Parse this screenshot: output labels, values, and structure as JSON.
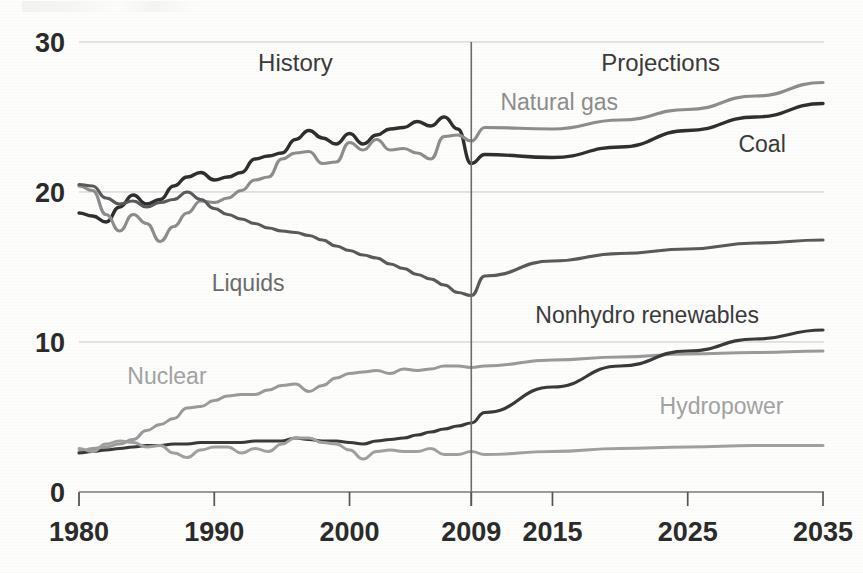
{
  "chart_data": {
    "type": "line",
    "title": "",
    "xlabel": "",
    "ylabel": "",
    "xlim": [
      1980,
      2035
    ],
    "ylim": [
      0,
      30
    ],
    "grid": true,
    "grid_axis": "y",
    "legend_position": "inline-annotations",
    "y_ticks": [
      0,
      10,
      20,
      30
    ],
    "y_tick_labels": [
      "0",
      "10",
      "20",
      "30"
    ],
    "x_ticks": [
      1980,
      1990,
      2000,
      2009,
      2015,
      2025,
      2035
    ],
    "x_tick_labels": [
      "1980",
      "1990",
      "2000",
      "2009",
      "2015",
      "2025",
      "2035"
    ],
    "annotations": [
      {
        "text": "History",
        "x": 1996,
        "y": 28.1,
        "color": "#3a3a3a"
      },
      {
        "text": "Projections",
        "x": 2023,
        "y": 28.1,
        "color": "#3a3a3a"
      },
      {
        "text": "Natural gas",
        "x": 2015.5,
        "y": 25.5,
        "color": "#8d8d8d"
      },
      {
        "text": "Coal",
        "x": 2030.5,
        "y": 22.7,
        "color": "#3a3a3a"
      },
      {
        "text": "Liquids",
        "x": 1992.5,
        "y": 13.4,
        "color": "#6b6b6b"
      },
      {
        "text": "Nonhydro renewables",
        "x": 2022,
        "y": 11.3,
        "color": "#3a3a3a"
      },
      {
        "text": "Nuclear",
        "x": 1986.5,
        "y": 7.2,
        "color": "#a2a2a2"
      },
      {
        "text": "Hydropower",
        "x": 2027.5,
        "y": 5.2,
        "color": "#a2a2a2"
      }
    ],
    "divider": {
      "x": 2009,
      "label": "history-projection-divider"
    },
    "series": [
      {
        "name": "Coal",
        "color": "#2f2f2f",
        "width": 3.4,
        "x": [
          1980,
          1981,
          1982,
          1983,
          1984,
          1985,
          1986,
          1987,
          1988,
          1989,
          1990,
          1991,
          1992,
          1993,
          1994,
          1995,
          1996,
          1997,
          1998,
          1999,
          2000,
          2001,
          2002,
          2003,
          2004,
          2005,
          2006,
          2007,
          2008,
          2009,
          2010,
          2015,
          2020,
          2025,
          2030,
          2035
        ],
        "values": [
          18.6,
          18.4,
          18.0,
          19.0,
          19.8,
          19.2,
          19.5,
          20.4,
          21.0,
          21.3,
          20.8,
          21.0,
          21.3,
          22.2,
          22.4,
          22.6,
          23.5,
          24.1,
          23.6,
          23.2,
          23.9,
          23.2,
          23.8,
          24.2,
          24.3,
          24.7,
          24.4,
          25.0,
          24.2,
          21.9,
          22.5,
          22.3,
          23.0,
          24.1,
          25.0,
          25.9
        ]
      },
      {
        "name": "Natural gas",
        "color": "#8d8d8d",
        "width": 3.2,
        "x": [
          1980,
          1981,
          1982,
          1983,
          1984,
          1985,
          1986,
          1987,
          1988,
          1989,
          1990,
          1991,
          1992,
          1993,
          1994,
          1995,
          1996,
          1997,
          1998,
          1999,
          2000,
          2001,
          2002,
          2003,
          2004,
          2005,
          2006,
          2007,
          2008,
          2009,
          2010,
          2015,
          2020,
          2025,
          2030,
          2035
        ],
        "values": [
          20.4,
          20.1,
          18.5,
          17.4,
          18.5,
          17.9,
          16.7,
          17.7,
          18.6,
          19.4,
          19.3,
          19.6,
          20.1,
          20.8,
          21.0,
          22.2,
          22.6,
          22.7,
          21.9,
          22.0,
          23.3,
          22.8,
          23.5,
          22.8,
          22.9,
          22.6,
          22.2,
          23.7,
          23.8,
          23.4,
          24.3,
          24.2,
          24.8,
          25.5,
          26.4,
          27.3
        ]
      },
      {
        "name": "Liquids",
        "color": "#5a5a5a",
        "width": 3.2,
        "x": [
          1980,
          1981,
          1982,
          1983,
          1984,
          1985,
          1986,
          1987,
          1988,
          1989,
          1990,
          1991,
          1992,
          1993,
          1994,
          1995,
          1996,
          1997,
          1998,
          1999,
          2000,
          2001,
          2002,
          2003,
          2004,
          2005,
          2006,
          2007,
          2008,
          2009,
          2010,
          2015,
          2020,
          2025,
          2030,
          2035
        ],
        "values": [
          20.5,
          20.4,
          19.6,
          19.2,
          19.4,
          19.0,
          19.3,
          19.5,
          20.0,
          19.5,
          18.9,
          18.5,
          18.2,
          17.9,
          17.6,
          17.4,
          17.3,
          17.1,
          16.8,
          16.4,
          16.1,
          15.8,
          15.6,
          15.2,
          14.9,
          14.5,
          14.2,
          13.8,
          13.3,
          13.1,
          14.4,
          15.4,
          15.9,
          16.2,
          16.6,
          16.8
        ]
      },
      {
        "name": "Nuclear",
        "color": "#9a9a9a",
        "width": 3.0,
        "x": [
          1980,
          1981,
          1982,
          1983,
          1984,
          1985,
          1986,
          1987,
          1988,
          1989,
          1990,
          1991,
          1992,
          1993,
          1994,
          1995,
          1996,
          1997,
          1998,
          1999,
          2000,
          2001,
          2002,
          2003,
          2004,
          2005,
          2006,
          2007,
          2008,
          2009,
          2010,
          2015,
          2020,
          2025,
          2030,
          2035
        ],
        "values": [
          2.7,
          2.9,
          3.0,
          3.2,
          3.5,
          4.1,
          4.5,
          4.9,
          5.6,
          5.7,
          6.1,
          6.4,
          6.5,
          6.5,
          6.8,
          7.1,
          7.2,
          6.7,
          7.1,
          7.6,
          7.9,
          8.0,
          8.1,
          7.9,
          8.2,
          8.1,
          8.2,
          8.4,
          8.4,
          8.3,
          8.4,
          8.8,
          9.0,
          9.2,
          9.3,
          9.4
        ]
      },
      {
        "name": "Nonhydro renewables",
        "color": "#3a3a3a",
        "width": 3.2,
        "x": [
          1980,
          1981,
          1982,
          1983,
          1984,
          1985,
          1986,
          1987,
          1988,
          1989,
          1990,
          1991,
          1992,
          1993,
          1994,
          1995,
          1996,
          1997,
          1998,
          1999,
          2000,
          2001,
          2002,
          2003,
          2004,
          2005,
          2006,
          2007,
          2008,
          2009,
          2010,
          2015,
          2020,
          2025,
          2030,
          2035
        ],
        "values": [
          2.6,
          2.7,
          2.8,
          2.9,
          3.0,
          3.1,
          3.1,
          3.2,
          3.2,
          3.3,
          3.3,
          3.3,
          3.3,
          3.4,
          3.4,
          3.4,
          3.6,
          3.5,
          3.4,
          3.4,
          3.3,
          3.2,
          3.4,
          3.5,
          3.6,
          3.8,
          4.0,
          4.2,
          4.4,
          4.6,
          5.3,
          7.0,
          8.4,
          9.4,
          10.2,
          10.8
        ]
      },
      {
        "name": "Hydropower",
        "color": "#a0a0a0",
        "width": 3.0,
        "x": [
          1980,
          1981,
          1982,
          1983,
          1984,
          1985,
          1986,
          1987,
          1988,
          1989,
          1990,
          1991,
          1992,
          1993,
          1994,
          1995,
          1996,
          1997,
          1998,
          1999,
          2000,
          2001,
          2002,
          2003,
          2004,
          2005,
          2006,
          2007,
          2008,
          2009,
          2010,
          2015,
          2020,
          2025,
          2030,
          2035
        ],
        "values": [
          2.9,
          2.7,
          3.2,
          3.4,
          3.3,
          3.0,
          3.1,
          2.6,
          2.3,
          2.8,
          3.0,
          3.0,
          2.6,
          2.9,
          2.7,
          3.2,
          3.6,
          3.6,
          3.3,
          3.2,
          2.8,
          2.2,
          2.7,
          2.8,
          2.7,
          2.7,
          2.9,
          2.5,
          2.5,
          2.7,
          2.5,
          2.7,
          2.9,
          3.0,
          3.1,
          3.1
        ]
      }
    ]
  },
  "axis": {
    "y_label_text": "",
    "x_label_text": ""
  }
}
